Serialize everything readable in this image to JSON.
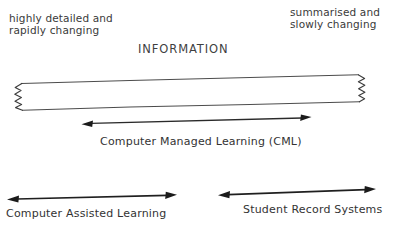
{
  "diagram": {
    "title": "INFORMATION",
    "top_left_caption_line1": "highly detailed and",
    "top_left_caption_line2": "rapidly changing",
    "top_right_caption_line1": "summarised and",
    "top_right_caption_line2": "slowly changing",
    "top_left_caption": "highly detailed and\nrapidly changing",
    "top_right_caption": "summarised and\nslowly changing",
    "band": {
      "name": "information-spectrum-band",
      "left_end_style": "squiggle-break",
      "right_end_style": "squiggle-break",
      "description": "tapering band representing the information continuum"
    },
    "arrows": [
      {
        "id": "cml",
        "label": "Computer Managed Learning (CML)",
        "style": "double-headed",
        "span": "middle"
      },
      {
        "id": "cal",
        "label": "Computer Assisted Learning",
        "style": "double-headed",
        "span": "left"
      },
      {
        "id": "srs",
        "label": "Student Record Systems",
        "style": "double-headed",
        "span": "right"
      }
    ],
    "colors": {
      "ink": "#1f1f1f",
      "text": "#3a3a3a",
      "band_stroke": "#4c4c4c",
      "background": "#ffffff"
    }
  }
}
